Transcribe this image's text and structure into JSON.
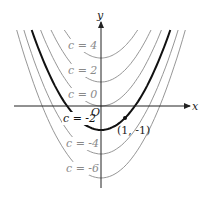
{
  "figure": {
    "axis_x_label": "x",
    "axis_y_label": "y",
    "origin_label": "O",
    "point_label": "(1, -1)",
    "colors": {
      "curve": "#8a8a8a",
      "highlight_curve": "#111111",
      "axis": "#222222",
      "label_grey": "#8a8a8a"
    },
    "curves": [
      {
        "c": 4,
        "label": "c = 4",
        "highlight": false
      },
      {
        "c": 2,
        "label": "c = 2",
        "highlight": false
      },
      {
        "c": 0,
        "label": "c = 0",
        "highlight": false
      },
      {
        "c": -2,
        "label": "c = -2",
        "highlight": true
      },
      {
        "c": -4,
        "label": "c = -4",
        "highlight": false
      },
      {
        "c": -6,
        "label": "c = -6",
        "highlight": false
      }
    ],
    "point": {
      "x": 1,
      "y": -1
    }
  },
  "chart_data": {
    "type": "line",
    "title": "",
    "xlabel": "x",
    "ylabel": "y",
    "equation_family": "y = x^2 + c",
    "series": [
      {
        "name": "c = 4",
        "vertex": [
          0,
          4
        ]
      },
      {
        "name": "c = 2",
        "vertex": [
          0,
          2
        ]
      },
      {
        "name": "c = 0",
        "vertex": [
          0,
          0
        ]
      },
      {
        "name": "c = -2",
        "vertex": [
          0,
          -2
        ],
        "highlight": true
      },
      {
        "name": "c = -4",
        "vertex": [
          0,
          -4
        ]
      },
      {
        "name": "c = -6",
        "vertex": [
          0,
          -6
        ]
      }
    ],
    "annotations": [
      {
        "text": "(1, -1)",
        "x": 1,
        "y": -1
      },
      {
        "text": "O",
        "x": 0,
        "y": 0
      }
    ],
    "grid": false,
    "legend": "inline labels on left branches"
  }
}
